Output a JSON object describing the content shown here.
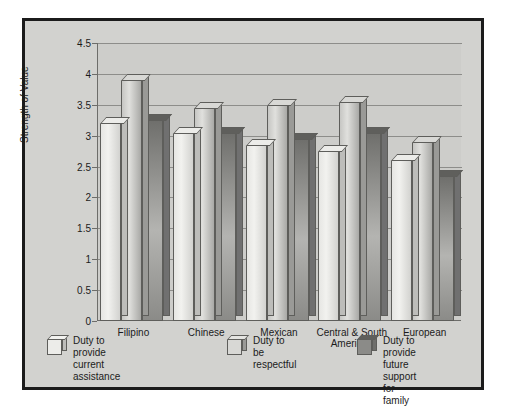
{
  "chart_data": {
    "type": "bar",
    "title": "",
    "xlabel": "",
    "ylabel": "Strength of Value",
    "ylim": [
      0,
      4.5
    ],
    "ytick_labels": [
      "4.5",
      "4",
      "3.5",
      "3",
      "2.5",
      "2",
      "1.5",
      "1",
      "0.5",
      "0"
    ],
    "ytick_values": [
      4.5,
      4,
      3.5,
      3,
      2.5,
      2,
      1.5,
      1,
      0.5,
      0
    ],
    "grid": true,
    "legend_position": "bottom",
    "categories": [
      "Filipino",
      "Chinese",
      "Mexican",
      "Central & South American",
      "European"
    ],
    "series": [
      {
        "name": "Duty to provide current assistance",
        "color": "#ececE9",
        "values": [
          3.2,
          3.05,
          2.85,
          2.75,
          2.6
        ]
      },
      {
        "name": "Duty to be respectful",
        "color": "#d8d8d5",
        "values": [
          3.9,
          3.45,
          3.5,
          3.55,
          2.9
        ]
      },
      {
        "name": "Duty to provide future support for family",
        "color": "#8b8b88",
        "values": [
          3.25,
          3.05,
          2.95,
          3.05,
          2.35
        ]
      }
    ]
  },
  "legend": {
    "items": [
      {
        "label_line1": "Duty to provide",
        "label_line2": "current assistance"
      },
      {
        "label_line1": "Duty to be respectful",
        "label_line2": ""
      },
      {
        "label_line1": "Duty to provide future",
        "label_line2": "support for family"
      }
    ]
  },
  "axis": {
    "y_title": "Strength of Value"
  }
}
